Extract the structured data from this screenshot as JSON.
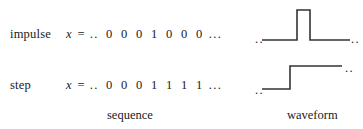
{
  "figure": {
    "title_rows": [
      {
        "name": "impulse",
        "label": "impulse",
        "variable": "x",
        "equals": "=",
        "leading_dots": "..",
        "digits": [
          "0",
          "0",
          "0",
          "1",
          "0",
          "0",
          "0"
        ],
        "trailing_dots": "...",
        "waveform": {
          "type": "impulse",
          "left_dots": "..",
          "right_dots": "..",
          "description": "rectangular unit pulse"
        }
      },
      {
        "name": "step",
        "label": "step",
        "variable": "x",
        "equals": "=",
        "leading_dots": "..",
        "digits": [
          "0",
          "0",
          "0",
          "1",
          "1",
          "1",
          "1"
        ],
        "trailing_dots": "...",
        "waveform": {
          "type": "step",
          "left_dots": "..",
          "right_dots": "..",
          "description": "rising unit step"
        }
      }
    ],
    "captions": {
      "sequence": "sequence",
      "waveform": "waveform"
    },
    "colors": {
      "ink": "#1a1a1a",
      "line": "#333333",
      "background": "#ffffff"
    }
  }
}
